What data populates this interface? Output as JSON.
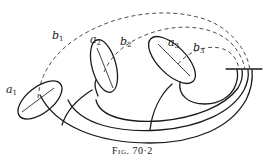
{
  "figure": {
    "caption_prefix": "Fig.",
    "caption_number": "70·2",
    "stroke_color": "#1a1a1a",
    "background_color": "#ffffff"
  },
  "labels": {
    "a1": {
      "base": "a",
      "sub": "1"
    },
    "a2": {
      "base": "a",
      "sub": "2"
    },
    "a3": {
      "base": "a",
      "sub": "3"
    },
    "b1": {
      "base": "b",
      "sub": "1"
    },
    "b2": {
      "base": "b",
      "sub": "2"
    },
    "b3": {
      "base": "b",
      "sub": "3"
    }
  },
  "curves": {
    "a_cycles": [
      "a1",
      "a2",
      "a3"
    ],
    "b_cycles": [
      "b1",
      "b2",
      "b3"
    ],
    "b_style": "dashed",
    "a_style": "solid ellipse with inner axis segment"
  }
}
